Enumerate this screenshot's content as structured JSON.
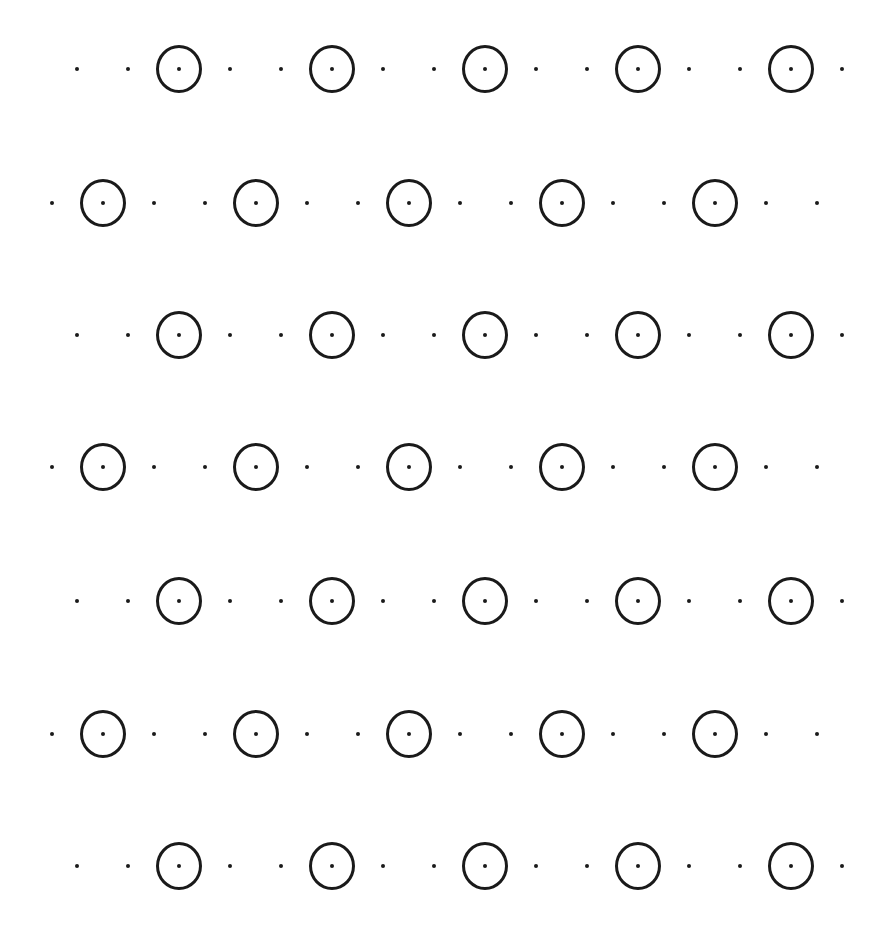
{
  "pattern": {
    "colors": {
      "background": "#ffffff",
      "ink": "#1a1a1a"
    },
    "cell_spacing_x": 51,
    "rows": [
      {
        "y": 69,
        "start_x": 77,
        "sequence": "..O..O..O..O..O."
      },
      {
        "y": 203,
        "start_x": 52,
        "sequence": ".O..O..O..O..O.."
      },
      {
        "y": 335,
        "start_x": 77,
        "sequence": "..O..O..O..O..O."
      },
      {
        "y": 467,
        "start_x": 52,
        "sequence": ".O..O..O..O..O.."
      },
      {
        "y": 601,
        "start_x": 77,
        "sequence": "..O..O..O..O..O."
      },
      {
        "y": 734,
        "start_x": 52,
        "sequence": ".O..O..O..O..O.."
      },
      {
        "y": 866,
        "start_x": 77,
        "sequence": "..O..O..O..O..O."
      }
    ],
    "legend": {
      "dot": "small dot",
      "O": "circled dot"
    }
  }
}
